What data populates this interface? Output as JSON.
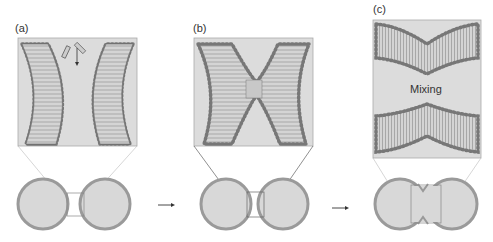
{
  "panels": [
    {
      "label": "(a)",
      "stage": "hemifusion-initiation"
    },
    {
      "label": "(b)",
      "stage": "stalk-formation"
    },
    {
      "label": "(c)",
      "stage": "fusion-pore",
      "caption": "Mixing"
    }
  ],
  "colors": {
    "lipid_head": "#7a7a7a",
    "lipid_tail": "#c8c8c8",
    "lumen": "#d8d8d8",
    "outline": "#999999",
    "arrow": "#333333"
  }
}
